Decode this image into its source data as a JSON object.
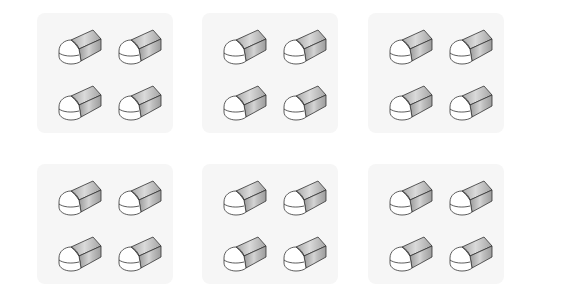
{
  "figure": {
    "rows": 2,
    "columns": 3,
    "colors": {
      "background": "#ffffff",
      "panel_fill": "#f6f6f6",
      "eraser_body_dark": "#9a9a9a",
      "eraser_body_light": "#d2d2d2",
      "eraser_cap": "#ffffff",
      "outline": "#333333"
    },
    "panels": [
      {
        "id": "panel-1",
        "x": 37,
        "y": 13,
        "erasers": 4
      },
      {
        "id": "panel-2",
        "x": 202,
        "y": 13,
        "erasers": 4
      },
      {
        "id": "panel-3",
        "x": 368,
        "y": 13,
        "erasers": 4
      },
      {
        "id": "panel-4",
        "x": 37,
        "y": 164,
        "erasers": 4
      },
      {
        "id": "panel-5",
        "x": 202,
        "y": 164,
        "erasers": 4
      },
      {
        "id": "panel-6",
        "x": 368,
        "y": 164,
        "erasers": 4
      }
    ],
    "eraser_offsets": [
      {
        "dx": 20,
        "dy": 15
      },
      {
        "dx": 80,
        "dy": 15
      },
      {
        "dx": 20,
        "dy": 71
      },
      {
        "dx": 80,
        "dy": 71
      }
    ]
  }
}
